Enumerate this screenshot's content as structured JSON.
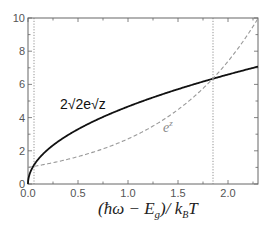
{
  "chart_data": {
    "type": "line",
    "title": "",
    "xlabel": "(ħω − E_g)/ k_B T",
    "ylabel": "",
    "xlim": [
      0,
      2.3
    ],
    "ylim": [
      0,
      10
    ],
    "grid": false,
    "legend": "none (inline annotations)",
    "x_ticks": [
      "0.0",
      "0.5",
      "1.0",
      "1.5",
      "2.0"
    ],
    "y_ticks": [
      "0",
      "2",
      "4",
      "6",
      "8",
      "10"
    ],
    "series": [
      {
        "name": "2√(2e)√z",
        "style": "solid",
        "color": "#111111",
        "x": [
          0,
          0.06,
          0.25,
          0.5,
          0.75,
          1.0,
          1.25,
          1.5,
          1.85,
          2.0,
          2.3
        ],
        "y": [
          0,
          1.14,
          2.33,
          3.3,
          4.04,
          4.66,
          5.21,
          5.71,
          6.34,
          6.59,
          7.07
        ]
      },
      {
        "name": "e^z",
        "style": "dashed",
        "color": "#999999",
        "x": [
          0,
          0.06,
          0.25,
          0.5,
          0.75,
          1.0,
          1.25,
          1.5,
          1.85,
          2.0,
          2.3
        ],
        "y": [
          1.0,
          1.06,
          1.28,
          1.65,
          2.12,
          2.72,
          3.49,
          4.48,
          6.36,
          7.39,
          9.97
        ]
      }
    ],
    "reference_lines": [
      {
        "orientation": "vertical",
        "x": 0.06,
        "style": "dotted",
        "note": "first intersection"
      },
      {
        "orientation": "vertical",
        "x": 1.85,
        "style": "dotted",
        "note": "second intersection"
      }
    ],
    "annotations": [
      {
        "text": "2√2e√z",
        "near_series": "2√(2e)√z",
        "x": 0.35,
        "y": 4.8
      },
      {
        "text": "e^z",
        "near_series": "e^z",
        "x": 1.4,
        "y": 3.3
      }
    ]
  },
  "labels": {
    "solid_curve": "2√2e√z",
    "dashed_base": "e",
    "dashed_exp": "z",
    "xlabel": "(ħω − E",
    "xlabel_sub": "g",
    "xlabel_mid": ")/ k",
    "xlabel_sub2": "B",
    "xlabel_end": "T"
  }
}
